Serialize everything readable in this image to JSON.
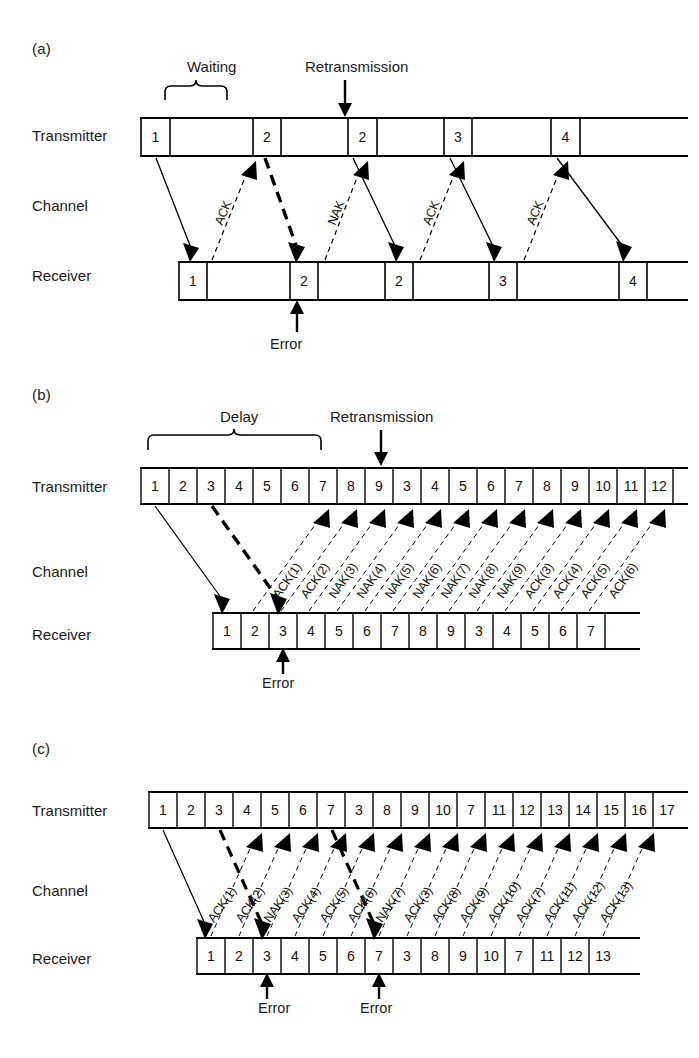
{
  "figure": {
    "background_color": "#ffffff",
    "line_color": "#000000"
  },
  "row_labels": {
    "transmitter": "Transmitter",
    "channel": "Channel",
    "receiver": "Receiver"
  },
  "labels": {
    "waiting": "Waiting",
    "delay": "Delay",
    "retransmission": "Retransmission",
    "error": "Error"
  },
  "panels": [
    {
      "letter": "(a)",
      "scheme": "stop-and-wait",
      "annotations": [
        "Waiting",
        "Retransmission"
      ],
      "transmitter_frames": [
        "1",
        "2",
        "2",
        "3",
        "4"
      ],
      "receiver_frames": [
        "1",
        "2",
        "2",
        "3",
        "4"
      ],
      "channel_labels": [
        "ACK",
        "NAK",
        "ACK",
        "ACK"
      ],
      "error_labels": [
        "Error"
      ],
      "error_count": 1
    },
    {
      "letter": "(b)",
      "scheme": "go-back-n",
      "annotations": [
        "Delay",
        "Retransmission"
      ],
      "transmitter_frames": [
        "1",
        "2",
        "3",
        "4",
        "5",
        "6",
        "7",
        "8",
        "9",
        "3",
        "4",
        "5",
        "6",
        "7",
        "8",
        "9",
        "10",
        "11",
        "12"
      ],
      "receiver_frames": [
        "1",
        "2",
        "3",
        "4",
        "5",
        "6",
        "7",
        "8",
        "9",
        "3",
        "4",
        "5",
        "6",
        "7"
      ],
      "channel_labels": [
        "ACK(1)",
        "ACK(2)",
        "NAK(3)",
        "NAK(4)",
        "NAK(5)",
        "NAK(6)",
        "NAK(7)",
        "NAK(8)",
        "NAK(9)",
        "ACK(3)",
        "ACK(4)",
        "ACK(5)",
        "ACK(6)"
      ],
      "error_labels": [
        "Error"
      ],
      "error_count": 1
    },
    {
      "letter": "(c)",
      "scheme": "selective-repeat",
      "annotations": [],
      "transmitter_frames": [
        "1",
        "2",
        "3",
        "4",
        "5",
        "6",
        "7",
        "3",
        "8",
        "9",
        "10",
        "7",
        "11",
        "12",
        "13",
        "14",
        "15",
        "16",
        "17"
      ],
      "receiver_frames": [
        "1",
        "2",
        "3",
        "4",
        "5",
        "6",
        "7",
        "3",
        "8",
        "9",
        "10",
        "7",
        "11",
        "12",
        "13"
      ],
      "channel_labels": [
        "ACK(1)",
        "ACK(2)",
        "NAK(3)",
        "ACK(4)",
        "ACK(5)",
        "ACK(6)",
        "NAK(7)",
        "ACK(3)",
        "ACK(8)",
        "ACK(9)",
        "ACK(10)",
        "ACK(7)",
        "ACK(11)",
        "ACK(12)",
        "ACK(13)"
      ],
      "error_labels": [
        "Error",
        "Error"
      ],
      "error_count": 2
    }
  ]
}
